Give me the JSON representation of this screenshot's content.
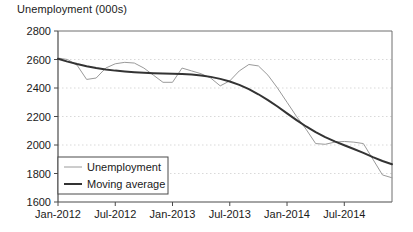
{
  "chart_data": {
    "type": "line",
    "title": "Unemployment (000s)",
    "xlabel": "",
    "ylabel": "",
    "ylim": [
      1600,
      2800
    ],
    "yticks": [
      1600,
      1800,
      2000,
      2200,
      2400,
      2600,
      2800
    ],
    "grid": true,
    "grid_style": "dotted-horizontal",
    "legend_position": "bottom-left",
    "xtick_labels": [
      "Jan-2012",
      "Jul-2012",
      "Jan-2013",
      "Jul-2013",
      "Jan-2014",
      "Jul-2014"
    ],
    "xtick_indices": [
      0,
      6,
      12,
      18,
      24,
      30
    ],
    "x": [
      "Jan-2012",
      "Feb-2012",
      "Mar-2012",
      "Apr-2012",
      "May-2012",
      "Jun-2012",
      "Jul-2012",
      "Aug-2012",
      "Sep-2012",
      "Oct-2012",
      "Nov-2012",
      "Dec-2012",
      "Jan-2013",
      "Feb-2013",
      "Mar-2013",
      "Apr-2013",
      "May-2013",
      "Jun-2013",
      "Jul-2013",
      "Aug-2013",
      "Sep-2013",
      "Oct-2013",
      "Nov-2013",
      "Dec-2013",
      "Jan-2014",
      "Feb-2014",
      "Mar-2014",
      "Apr-2014",
      "May-2014",
      "Jun-2014",
      "Jul-2014",
      "Aug-2014",
      "Sep-2014",
      "Oct-2014",
      "Nov-2014",
      "Dec-2014"
    ],
    "series": [
      {
        "name": "Unemployment",
        "color": "#9a9a9a",
        "width": 1,
        "values": [
          2610,
          2600,
          2560,
          2460,
          2470,
          2540,
          2570,
          2580,
          2575,
          2540,
          2490,
          2440,
          2440,
          2540,
          2520,
          2500,
          2470,
          2415,
          2450,
          2520,
          2565,
          2555,
          2490,
          2400,
          2300,
          2200,
          2110,
          2010,
          2005,
          2020,
          2025,
          2020,
          2010,
          1900,
          1790,
          1770
        ]
      },
      {
        "name": "Moving average",
        "color": "#333333",
        "width": 2,
        "values": [
          2605,
          2585,
          2568,
          2553,
          2540,
          2530,
          2522,
          2516,
          2511,
          2507,
          2504,
          2502,
          2500,
          2498,
          2494,
          2488,
          2478,
          2464,
          2446,
          2422,
          2392,
          2356,
          2315,
          2270,
          2222,
          2175,
          2130,
          2090,
          2055,
          2025,
          1998,
          1972,
          1945,
          1915,
          1888,
          1865
        ]
      }
    ]
  },
  "legend": {
    "items": [
      {
        "label": "Unemployment"
      },
      {
        "label": "Moving average"
      }
    ]
  }
}
